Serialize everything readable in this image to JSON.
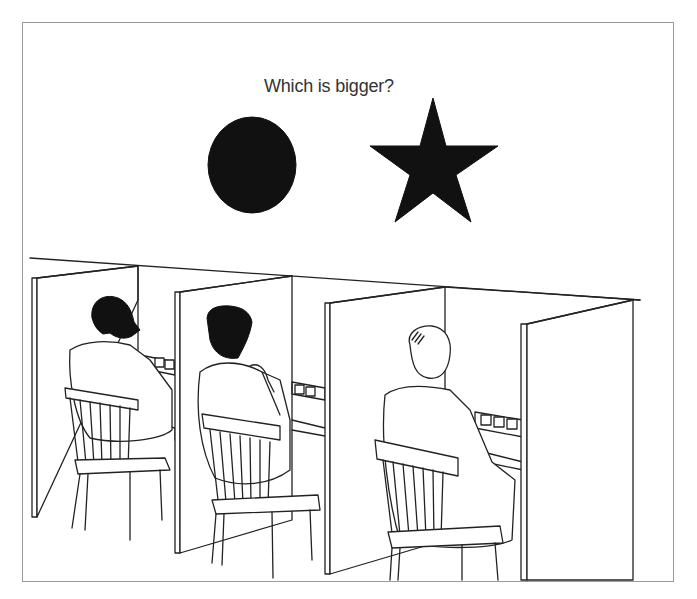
{
  "illustration": {
    "caption": "Which is bigger?",
    "shapes": [
      {
        "name": "circle",
        "kind": "ellipse",
        "color": "#111111"
      },
      {
        "name": "star",
        "kind": "five-point-star",
        "color": "#111111"
      }
    ],
    "scene": "Three men seated on wooden chairs in separate cubicles facing control panels",
    "cubicles": 3,
    "people": [
      {
        "position": "left",
        "description": "bearded man"
      },
      {
        "position": "middle",
        "description": "man with hand on chin"
      },
      {
        "position": "right",
        "description": "balding man"
      }
    ],
    "colors": {
      "ink": "#222222",
      "background": "#ffffff",
      "frame": "#9a9a9a"
    }
  }
}
